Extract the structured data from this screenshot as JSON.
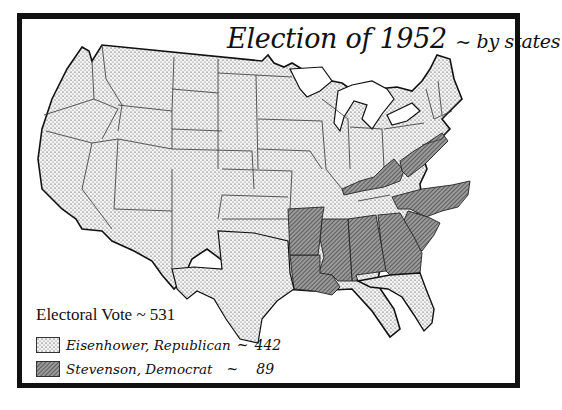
{
  "map": {
    "title": "Election of 1952",
    "subtitle": "~ by states",
    "colors": {
      "republican_fill": "#e6e6e6",
      "democrat_fill": "#8c8c8c",
      "border": "#111111"
    },
    "legend": {
      "total_label": "Electoral Vote ~ 531",
      "entries": [
        {
          "label": "Eisenhower, Republican",
          "separator": "~",
          "count": "442",
          "pattern": "stipple"
        },
        {
          "label": "Stevenson, Democrat",
          "separator": "~",
          "count": "89",
          "pattern": "hatch"
        }
      ]
    },
    "states_democrat": [
      "Kentucky",
      "West Virginia",
      "North Carolina",
      "South Carolina",
      "Georgia",
      "Alabama",
      "Mississippi",
      "Louisiana",
      "Arkansas"
    ],
    "states_republican_note": "All other states (39 of 48)"
  }
}
